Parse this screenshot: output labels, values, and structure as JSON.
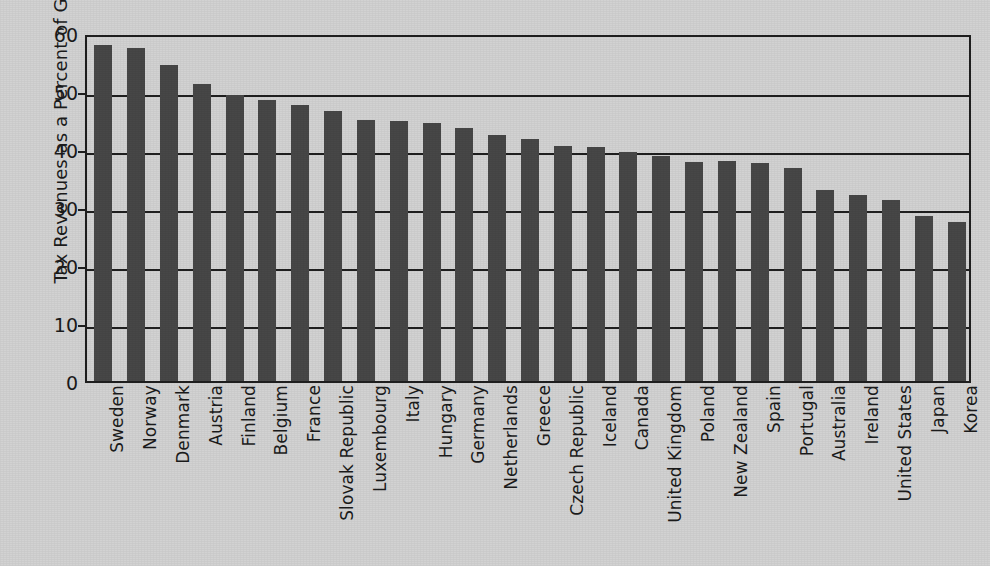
{
  "chart_data": {
    "type": "bar",
    "title": "",
    "xlabel": "",
    "ylabel": "Tax Revenues as a Percent of GDP",
    "ylim": [
      0,
      60
    ],
    "yticks": [
      0,
      10,
      20,
      30,
      40,
      50,
      60
    ],
    "grid": true,
    "legend": "none",
    "bar_color": "#474747",
    "background_color": "#d2d2d2",
    "axis_color": "#1f1f1f",
    "categories": [
      "Sweden",
      "Norway",
      "Denmark",
      "Austria",
      "Finland",
      "Belgium",
      "France",
      "Slovak Republic",
      "Luxembourg",
      "Italy",
      "Hungary",
      "Germany",
      "Netherlands",
      "Greece",
      "Czech Republic",
      "Iceland",
      "Canada",
      "United Kingdom",
      "Poland",
      "New Zealand",
      "Spain",
      "Portugal",
      "Australia",
      "Ireland",
      "United States",
      "Japan",
      "Korea"
    ],
    "values": [
      58.0,
      57.5,
      54.4,
      51.2,
      49.3,
      48.4,
      47.6,
      46.6,
      45.0,
      44.8,
      44.4,
      43.6,
      42.4,
      41.8,
      40.6,
      40.4,
      39.5,
      38.8,
      37.8,
      37.9,
      37.6,
      36.7,
      33.0,
      32.1,
      31.2,
      28.4,
      27.4
    ]
  }
}
